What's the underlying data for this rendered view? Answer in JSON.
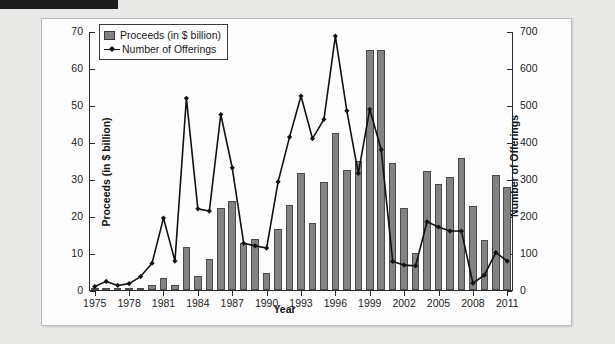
{
  "chart_data": {
    "type": "bar",
    "title": "",
    "xlabel": "Year",
    "ylabel": "Proceeds (in $ billion)",
    "y2label": "Number of Offerings",
    "grid": false,
    "legend_position": "top-left",
    "ylim": [
      0,
      70
    ],
    "y2lim": [
      0,
      700
    ],
    "xlim": [
      1975,
      2011
    ],
    "ytick_labels": [
      "0",
      "10",
      "20",
      "30",
      "40",
      "50",
      "60",
      "70"
    ],
    "ytick_values": [
      0,
      10,
      20,
      30,
      40,
      50,
      60,
      70
    ],
    "y2tick_labels": [
      "0",
      "100",
      "200",
      "300",
      "400",
      "500",
      "600",
      "700"
    ],
    "y2tick_values": [
      0,
      100,
      200,
      300,
      400,
      500,
      600,
      700
    ],
    "xtick_labels": [
      "1975",
      "1978",
      "1981",
      "1984",
      "1987",
      "1990",
      "1993",
      "1996",
      "1999",
      "2002",
      "2005",
      "2008",
      "2011"
    ],
    "xtick_values": [
      1975,
      1978,
      1981,
      1984,
      1987,
      1990,
      1993,
      1996,
      1999,
      2002,
      2005,
      2008,
      2011
    ],
    "categories": [
      1975,
      1976,
      1977,
      1978,
      1979,
      1980,
      1981,
      1982,
      1983,
      1984,
      1985,
      1986,
      1987,
      1988,
      1989,
      1990,
      1991,
      1992,
      1993,
      1994,
      1995,
      1996,
      1997,
      1998,
      1999,
      2000,
      2001,
      2002,
      2003,
      2004,
      2005,
      2006,
      2007,
      2008,
      2009,
      2010,
      2011
    ],
    "series": [
      {
        "name": "Proceeds (in $ billion)",
        "axis": "left",
        "kind": "bar",
        "color": "#838383",
        "edge_color": "#4a4a4a",
        "values": [
          0.2,
          0.3,
          0.2,
          0.3,
          0.5,
          1.4,
          3.2,
          1.4,
          11.6,
          3.9,
          8.5,
          22.3,
          24.0,
          12.8,
          13.8,
          4.5,
          16.4,
          22.9,
          31.5,
          18.0,
          29.3,
          42.4,
          32.5,
          35.0,
          65.0,
          65.0,
          34.3,
          22.3,
          10.1,
          32.3,
          28.6,
          30.6,
          35.7,
          22.8,
          13.4,
          31.2,
          27.9
        ]
      },
      {
        "name": "Number of Offerings",
        "axis": "right",
        "kind": "line",
        "color": "#111111",
        "marker": "diamond",
        "values": [
          12,
          26,
          15,
          20,
          39,
          75,
          197,
          81,
          521,
          222,
          216,
          477,
          333,
          129,
          122,
          116,
          295,
          416,
          527,
          412,
          464,
          689,
          487,
          318,
          491,
          382,
          80,
          70,
          68,
          187,
          173,
          162,
          162,
          21,
          43,
          104,
          81
        ]
      }
    ]
  },
  "legend": {
    "items": [
      {
        "label": "Proceeds (in $ billion)",
        "marker": "bar-swatch"
      },
      {
        "label": "Number of Offerings",
        "marker": "line-diamond"
      }
    ]
  },
  "colors": {
    "bar_fill": "#838383",
    "bar_edge": "#4a4a4a",
    "line": "#111111",
    "axis": "#2b2b2b",
    "panel_background": "#fdfdfd",
    "page_background": "#e9e9e7"
  }
}
